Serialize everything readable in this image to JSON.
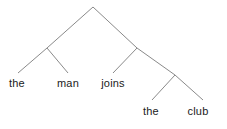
{
  "figure": {
    "kind": "constituency-parse-tree",
    "width": 227,
    "height": 129,
    "background_color": "#ffffff",
    "line_color": "#8a8a8a",
    "line_width": 1,
    "text_color": "#1a1a1a",
    "font_size_px": 11
  },
  "sentence": "the man joins the club",
  "leaves": [
    {
      "id": "leaf-the-1",
      "text": "the",
      "x": 17,
      "y": 83
    },
    {
      "id": "leaf-man",
      "text": "man",
      "x": 68,
      "y": 83
    },
    {
      "id": "leaf-joins",
      "text": "joins",
      "x": 113,
      "y": 83
    },
    {
      "id": "leaf-the-2",
      "text": "the",
      "x": 151,
      "y": 111
    },
    {
      "id": "leaf-club",
      "text": "club",
      "x": 198,
      "y": 111
    }
  ],
  "nodes": [
    {
      "id": "node-root",
      "x": 93,
      "y": 7
    },
    {
      "id": "node-left-phrase",
      "x": 47,
      "y": 48
    },
    {
      "id": "node-right-phrase",
      "x": 137,
      "y": 48
    },
    {
      "id": "node-lower-right",
      "x": 175,
      "y": 75
    }
  ],
  "edges": [
    {
      "id": "edge-root-to-left-phrase",
      "x1": 93,
      "y1": 7,
      "x2": 47,
      "y2": 48
    },
    {
      "id": "edge-root-to-right-phrase",
      "x1": 93,
      "y1": 7,
      "x2": 137,
      "y2": 48
    },
    {
      "id": "edge-left-phrase-to-the",
      "x1": 47,
      "y1": 48,
      "x2": 18,
      "y2": 73
    },
    {
      "id": "edge-left-phrase-to-man",
      "x1": 47,
      "y1": 48,
      "x2": 68,
      "y2": 73
    },
    {
      "id": "edge-right-phrase-to-joins",
      "x1": 137,
      "y1": 48,
      "x2": 113,
      "y2": 73
    },
    {
      "id": "edge-right-phrase-to-lower-right",
      "x1": 137,
      "y1": 48,
      "x2": 175,
      "y2": 75
    },
    {
      "id": "edge-lower-right-to-the",
      "x1": 175,
      "y1": 75,
      "x2": 152,
      "y2": 100
    },
    {
      "id": "edge-lower-right-to-club",
      "x1": 175,
      "y1": 75,
      "x2": 203,
      "y2": 100
    }
  ]
}
